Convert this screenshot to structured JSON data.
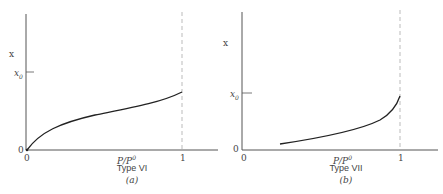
{
  "panels": [
    {
      "id": "a",
      "y_label": "x",
      "y_tick_x0": "x0",
      "y_origin": "0",
      "x_origin": "0",
      "x_label": "P/P0",
      "x_tick_one": "1",
      "type_label": "Type VI",
      "panel_label": "(a)"
    },
    {
      "id": "b",
      "y_label": "x",
      "y_tick_x0": "x0",
      "y_origin": "0",
      "x_origin": "0",
      "x_label": "P/P0",
      "x_tick_one": "1",
      "type_label": "Type VII",
      "panel_label": "(b)"
    }
  ],
  "chart_data": [
    {
      "type": "line",
      "title": "Type VI (a)",
      "xlabel": "P/P0",
      "ylabel": "x",
      "x_ticks": [
        "0",
        "1"
      ],
      "y_ticks": [
        "0",
        "x0"
      ],
      "series": [
        {
          "name": "isotherm",
          "x": [
            0,
            0.1,
            0.3,
            0.5,
            0.7,
            0.9,
            1.0
          ],
          "y": [
            0,
            0.25,
            0.42,
            0.5,
            0.57,
            0.67,
            0.75
          ]
        }
      ],
      "annotations": [
        "dashed vertical line at P/P0 = 1"
      ],
      "notes": "y in units of x0"
    },
    {
      "type": "line",
      "title": "Type VII (b)",
      "xlabel": "P/P0",
      "ylabel": "x",
      "x_ticks": [
        "0",
        "1"
      ],
      "y_ticks": [
        "0",
        "x0"
      ],
      "series": [
        {
          "name": "isotherm",
          "x": [
            0.24,
            0.4,
            0.6,
            0.8,
            0.9,
            1.0
          ],
          "y": [
            0.05,
            0.12,
            0.22,
            0.38,
            0.52,
            0.7
          ]
        }
      ],
      "annotations": [
        "dashed vertical line at P/P0 = 1"
      ],
      "notes": "y in units of x0"
    }
  ]
}
